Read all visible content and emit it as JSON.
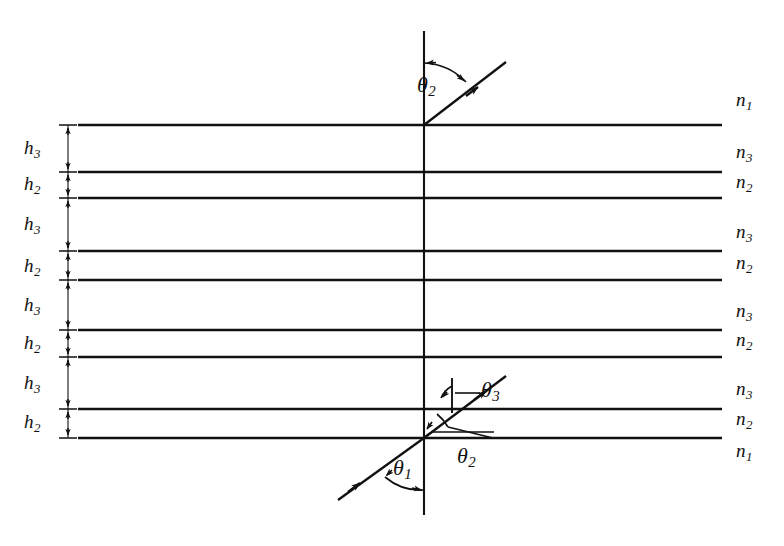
{
  "figure": {
    "type": "optics-ray-diagram",
    "background_color": "#ffffff",
    "line_color": "#111111",
    "width": 784,
    "height": 546
  },
  "media_labels": {
    "incident_top": "n",
    "incident_top_sub": "1",
    "layer_high": "n",
    "layer_high_sub": "3",
    "layer_low": "n",
    "layer_low_sub": "2",
    "substrate_bottom": "n",
    "substrate_bottom_sub": "1"
  },
  "right_labels": [
    {
      "base": "n",
      "sub": "1",
      "x": 736,
      "y": 100
    },
    {
      "base": "n",
      "sub": "3",
      "x": 736,
      "y": 152
    },
    {
      "base": "n",
      "sub": "2",
      "x": 736,
      "y": 180
    },
    {
      "base": "n",
      "sub": "3",
      "x": 736,
      "y": 230
    },
    {
      "base": "n",
      "sub": "2",
      "x": 736,
      "y": 260
    },
    {
      "base": "n",
      "sub": "3",
      "x": 736,
      "y": 308
    },
    {
      "base": "n",
      "sub": "2",
      "x": 736,
      "y": 337
    },
    {
      "base": "n",
      "sub": "3",
      "x": 736,
      "y": 386
    },
    {
      "base": "n",
      "sub": "2",
      "x": 736,
      "y": 416
    },
    {
      "base": "n",
      "sub": "1",
      "x": 736,
      "y": 448
    }
  ],
  "thickness_labels": [
    {
      "base": "h",
      "sub": "3",
      "x": 24,
      "y": 140
    },
    {
      "base": "h",
      "sub": "2",
      "x": 24,
      "y": 174
    },
    {
      "base": "h",
      "sub": "3",
      "x": 24,
      "y": 213
    },
    {
      "base": "h",
      "sub": "2",
      "x": 24,
      "y": 256
    },
    {
      "base": "h",
      "sub": "3",
      "x": 24,
      "y": 294
    },
    {
      "base": "h",
      "sub": "2",
      "x": 24,
      "y": 333
    },
    {
      "base": "h",
      "sub": "3",
      "x": 24,
      "y": 372
    },
    {
      "base": "h",
      "sub": "2",
      "x": 24,
      "y": 412
    }
  ],
  "angle_labels": [
    {
      "base": "θ",
      "sub": "2",
      "x": 417,
      "y": 74,
      "name": "theta2-top"
    },
    {
      "base": "θ",
      "sub": "3",
      "x": 481,
      "y": 381,
      "name": "theta3-bottom"
    },
    {
      "base": "θ",
      "sub": "2",
      "x": 457,
      "y": 447,
      "name": "theta2-bottom"
    },
    {
      "base": "θ",
      "sub": "1",
      "x": 395,
      "y": 459,
      "name": "theta1-bottom"
    }
  ],
  "interfaces": [
    {
      "y": 125,
      "x1": 78,
      "x2": 722
    },
    {
      "y": 172,
      "x1": 78,
      "x2": 722
    },
    {
      "y": 198,
      "x1": 78,
      "x2": 722
    },
    {
      "y": 251,
      "x1": 78,
      "x2": 722
    },
    {
      "y": 280,
      "x1": 78,
      "x2": 722
    },
    {
      "y": 330,
      "x1": 78,
      "x2": 722
    },
    {
      "y": 357,
      "x1": 78,
      "x2": 722
    },
    {
      "y": 409,
      "x1": 78,
      "x2": 722
    },
    {
      "y": 438,
      "x1": 78,
      "x2": 722
    }
  ],
  "dimension_line": {
    "x": 68,
    "y_top": 125,
    "y_bottom": 438,
    "tick_half_width": 9
  },
  "normal_line": {
    "x": 424,
    "y_top": 31,
    "y_bottom": 515
  },
  "rays": {
    "incident": {
      "x1": 338,
      "y1": 500,
      "x2": 424,
      "y2": 438
    },
    "internal": {
      "x1": 424,
      "y1": 438,
      "x2": 506,
      "y2": 376
    },
    "exit": {
      "x1": 424,
      "y1": 125,
      "x2": 506,
      "y2": 62
    }
  }
}
